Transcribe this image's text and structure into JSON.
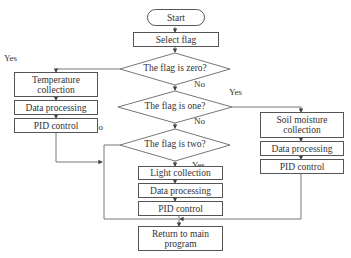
{
  "flowchart": {
    "start": "Start",
    "select_flag": "Select flag",
    "decisions": {
      "zero": "The flag is zero?",
      "one": "The flag is one?",
      "two": "The flag is two?"
    },
    "branch_zero": {
      "collection": "Temperature collection",
      "processing": "Data processing",
      "control": "PID control"
    },
    "branch_one": {
      "collection": "Soil moisture collection",
      "processing": "Data processing",
      "control": "PID control"
    },
    "branch_two": {
      "collection": "Light collection",
      "processing": "Data processing",
      "control": "PID control"
    },
    "end": "Return to main program",
    "edge_labels": {
      "zero_yes": "Yes",
      "zero_no": "No",
      "one_yes": "Yes",
      "one_no": "No",
      "two_yes": "Yes",
      "two_no": "No"
    },
    "colors": {
      "line": "#555555",
      "text": "#333333",
      "background": "#ffffff"
    }
  }
}
